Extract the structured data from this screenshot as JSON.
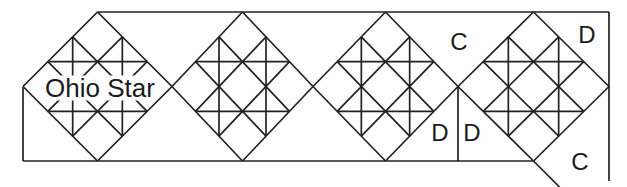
{
  "figure": {
    "width": 627,
    "height": 187,
    "background": "#fefefe",
    "stroke_color": "#222222",
    "stroke_width": 1.7,
    "block_pattern": "Ohio Star",
    "blocks": [
      {
        "id": "ohio-star-block-1",
        "cx": 97.5,
        "cy": 86.5,
        "hx": 74.5,
        "hy": 74.5
      },
      {
        "id": "ohio-star-block-2",
        "cx": 242.5,
        "cy": 86.5,
        "hx": 70.5,
        "hy": 74.5
      },
      {
        "id": "ohio-star-block-3",
        "cx": 385.5,
        "cy": 86.5,
        "hx": 72.5,
        "hy": 74.5
      },
      {
        "id": "ohio-star-block-4",
        "cx": 533.5,
        "cy": 86.5,
        "hx": 75.5,
        "hy": 74.5
      }
    ],
    "outline": [
      {
        "id": "top-edge",
        "x1": 97.5,
        "y1": 12,
        "x2": 609,
        "y2": 12
      },
      {
        "id": "right-edge",
        "x1": 609,
        "y1": 12,
        "x2": 609,
        "y2": 181
      },
      {
        "id": "bottom-edge",
        "x1": 23,
        "y1": 161,
        "x2": 533.5,
        "y2": 161
      },
      {
        "id": "left-edge",
        "x1": 23,
        "y1": 87,
        "x2": 23,
        "y2": 161
      },
      {
        "id": "setting-triangle-seam",
        "x1": 458,
        "y1": 86.5,
        "x2": 458,
        "y2": 161
      },
      {
        "id": "corner-cut-line",
        "x1": 533.5,
        "y1": 161,
        "x2": 559.5,
        "y2": 187
      }
    ],
    "labels": [
      {
        "id": "block-label-ohio-star",
        "text": "Ohio Star",
        "x": 100,
        "y": 88,
        "size": 26,
        "halo": true,
        "halo_w": 108,
        "halo_h": 25
      },
      {
        "id": "label-c-top",
        "text": "C",
        "x": 459,
        "y": 41,
        "size": 24,
        "halo": false
      },
      {
        "id": "label-d-top-right",
        "text": "D",
        "x": 587,
        "y": 34,
        "size": 24,
        "halo": false
      },
      {
        "id": "label-d-bottom-left",
        "text": "D",
        "x": 440,
        "y": 132,
        "size": 24,
        "halo": false
      },
      {
        "id": "label-d-bottom-right",
        "text": "D",
        "x": 472,
        "y": 132,
        "size": 24,
        "halo": false
      },
      {
        "id": "label-c-bottom-right",
        "text": "C",
        "x": 580,
        "y": 161,
        "size": 24,
        "halo": false
      }
    ]
  }
}
